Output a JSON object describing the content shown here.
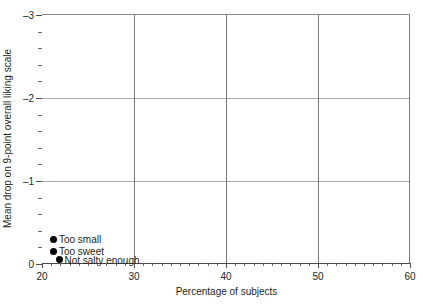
{
  "chart_data": {
    "type": "scatter",
    "title": "",
    "xlabel": "Percentage of subjects",
    "ylabel": "Mean drop on 9-point overall liking scale",
    "xlim": [
      20,
      60
    ],
    "ylim": [
      0,
      -3
    ],
    "y_inverted": true,
    "grid": true,
    "legend": "none",
    "xticks": [
      "20",
      "30",
      "40",
      "50",
      "60"
    ],
    "xtick_values": [
      20,
      30,
      40,
      50,
      60
    ],
    "yticks": [
      "0",
      "-1",
      "-2",
      "-3"
    ],
    "ytick_values": [
      0,
      -1,
      -2,
      -3
    ],
    "x_minor_ticks_per_interval": 9,
    "y_minor_ticks_per_interval": 4,
    "points": [
      {
        "label": "Too small",
        "x": 21.3,
        "y": -0.3
      },
      {
        "label": "Too sweet",
        "x": 21.3,
        "y": -0.155
      },
      {
        "label": "Not salty enough",
        "x": 21.9,
        "y": -0.05
      }
    ],
    "colors": {
      "marker": "#000000",
      "gridline": "#a8a8a8",
      "gridline_vertical": "#777777",
      "axis": "#4a4a4a",
      "text": "#231f20",
      "background": "#ffffff"
    }
  }
}
